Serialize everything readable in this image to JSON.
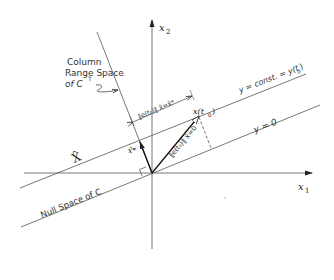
{
  "diagram": {
    "axes": {
      "x1_label": "x",
      "x1_sub": "1",
      "x2_label": "x",
      "x2_sub": "2"
    },
    "lines": {
      "column_range_label_1": "Column",
      "column_range_label_2": "Range Space",
      "column_range_label_3": "of C",
      "column_range_sup": "T",
      "null_space_label": "Null Space of C",
      "y_const_label": "y = const. = y(t",
      "y_const_sub": "0",
      "y_const_close": ")",
      "y_zero_label": "y = 0",
      "xhat_set_label": "X̂"
    },
    "vectors": {
      "x_t0_label": "x(t",
      "x_t0_sub": "0",
      "x_t0_close": ")",
      "xhat_star_label": "x̂*",
      "error_norm_xhat0": "‖e(t₀)‖ x̂=0",
      "error_norm_xhatstar": "‖e(t₀)‖ x̂=x̂*"
    },
    "colors": {
      "ink": "#333333",
      "background": "#ffffff"
    }
  }
}
